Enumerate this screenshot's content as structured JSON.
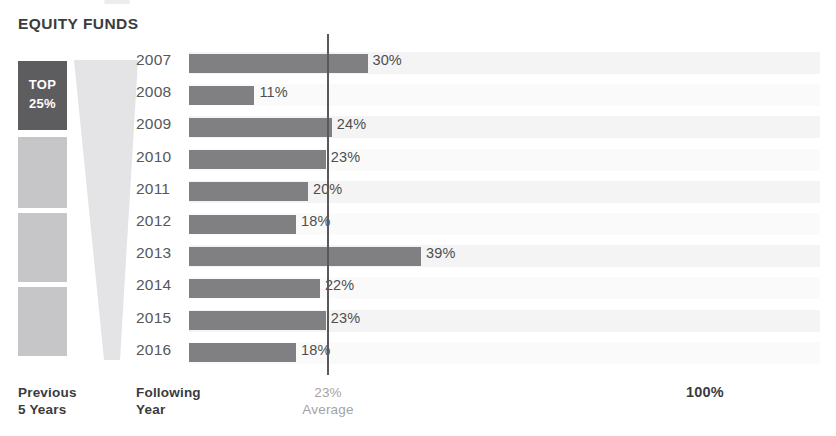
{
  "chart_data": {
    "type": "bar",
    "title": "EQUITY FUNDS",
    "orientation": "horizontal",
    "xlabel": "",
    "ylabel": "",
    "xlim": [
      0,
      100
    ],
    "grid": false,
    "legend": "none",
    "categories": [
      "2007",
      "2008",
      "2009",
      "2010",
      "2011",
      "2012",
      "2013",
      "2014",
      "2015",
      "2016"
    ],
    "values": [
      30,
      11,
      24,
      23,
      20,
      18,
      39,
      22,
      23,
      18
    ],
    "value_labels": [
      "30%",
      "11%",
      "24%",
      "23%",
      "20%",
      "18%",
      "39%",
      "22%",
      "23%",
      "18%"
    ],
    "annotations": [
      {
        "name": "average-line",
        "value": 23,
        "label": "23%",
        "sublabel": "Average"
      },
      {
        "name": "axis-max",
        "value": 100,
        "label": "100%"
      }
    ],
    "axis_labels": {
      "left_group": "Previous\n5 Years",
      "bar_group": "Following\nYear"
    }
  },
  "title": "EQUITY FUNDS",
  "funnel": {
    "top_block_label_line1": "TOP",
    "top_block_label_line2": "25%",
    "blocks": [
      {
        "name": "top-25-block",
        "label": "TOP 25%",
        "color": "#5d5d5f"
      },
      {
        "name": "quartile-block-2",
        "label": "",
        "color": "#c6c6c8"
      },
      {
        "name": "quartile-block-3",
        "label": "",
        "color": "#c6c6c8"
      },
      {
        "name": "quartile-block-4",
        "label": "",
        "color": "#c6c6c8"
      }
    ]
  },
  "rows": [
    {
      "year": "2007",
      "value": 30,
      "label": "30%"
    },
    {
      "year": "2008",
      "value": 11,
      "label": "11%"
    },
    {
      "year": "2009",
      "value": 24,
      "label": "24%"
    },
    {
      "year": "2010",
      "value": 23,
      "label": "23%"
    },
    {
      "year": "2011",
      "value": 20,
      "label": "20%"
    },
    {
      "year": "2012",
      "value": 18,
      "label": "18%"
    },
    {
      "year": "2013",
      "value": 39,
      "label": "39%"
    },
    {
      "year": "2014",
      "value": 22,
      "label": "22%"
    },
    {
      "year": "2015",
      "value": 23,
      "label": "23%"
    },
    {
      "year": "2016",
      "value": 18,
      "label": "18%"
    }
  ],
  "footer": {
    "previous_line1": "Previous",
    "previous_line2": "5 Years",
    "following_line1": "Following",
    "following_line2": "Year",
    "average_value": "23%",
    "average_word": "Average",
    "max_label": "100%"
  },
  "colors": {
    "bar": "#808082",
    "top_block": "#5d5d5f",
    "quartile_block": "#c6c6c8",
    "average_line": "#59595b",
    "text_dark": "#3b3b3d",
    "text_muted": "#a3a3a6",
    "row_band": "#f4f4f5"
  }
}
